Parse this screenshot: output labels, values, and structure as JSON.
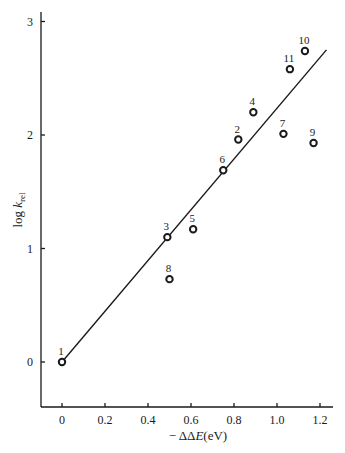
{
  "chart_data": {
    "type": "scatter",
    "title": "",
    "xlabel": "− ΔΔE(eV)",
    "ylabel": "log k_rel",
    "ylabel_main": "log k",
    "ylabel_sub": "rel",
    "xlim": [
      -0.1,
      1.26
    ],
    "ylim": [
      -0.4,
      3.1
    ],
    "xticks": [
      0,
      0.2,
      0.4,
      0.6,
      0.8,
      1.0,
      1.2
    ],
    "xtick_labels": [
      "0",
      "0.2",
      "0.4",
      "0.6",
      "0.8",
      "1.0",
      "1.2"
    ],
    "yticks": [
      0,
      1,
      2,
      3
    ],
    "ytick_labels": [
      "0",
      "1",
      "2",
      "3"
    ],
    "grid": false,
    "legend": null,
    "points": [
      {
        "label": "1",
        "x": 0.0,
        "y": 0.0
      },
      {
        "label": "2",
        "x": 0.82,
        "y": 1.96
      },
      {
        "label": "3",
        "x": 0.49,
        "y": 1.1
      },
      {
        "label": "4",
        "x": 0.89,
        "y": 2.2
      },
      {
        "label": "5",
        "x": 0.61,
        "y": 1.17
      },
      {
        "label": "6",
        "x": 0.75,
        "y": 1.69
      },
      {
        "label": "7",
        "x": 1.03,
        "y": 2.01
      },
      {
        "label": "8",
        "x": 0.5,
        "y": 0.73
      },
      {
        "label": "9",
        "x": 1.17,
        "y": 1.93
      },
      {
        "label": "10",
        "x": 1.13,
        "y": 2.74
      },
      {
        "label": "11",
        "x": 1.06,
        "y": 2.58
      }
    ],
    "fit_line": {
      "x": [
        0.0,
        1.23
      ],
      "y": [
        0.0,
        2.75
      ]
    }
  }
}
